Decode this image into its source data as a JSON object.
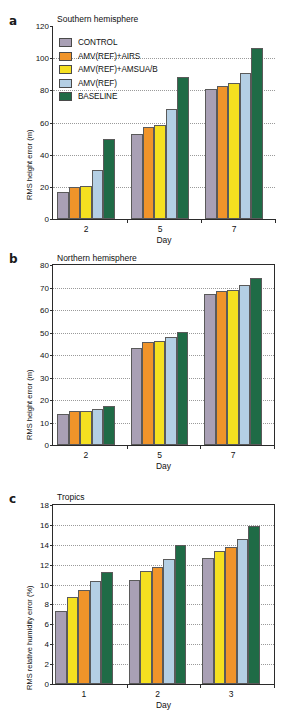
{
  "figure": {
    "xaxis_title": "Day",
    "series_colors": {
      "CONTROL": "#a9a0b5",
      "AMV(REF)+AIRS": "#f0942a",
      "AMV(REF)+AMSUA/B": "#f5e020",
      "AMV(REF)": "#b4cfe4",
      "BASELINE": "#1f6b46"
    }
  },
  "legend": {
    "items": [
      {
        "label": "CONTROL",
        "color": "#a9a0b5"
      },
      {
        "label": "AMV(REF)+AIRS",
        "color": "#f0942a"
      },
      {
        "label": "AMV(REF)+AMSUA/B",
        "color": "#f5e020"
      },
      {
        "label": "AMV(REF)",
        "color": "#b4cfe4"
      },
      {
        "label": "BASELINE",
        "color": "#1f6b46"
      }
    ]
  },
  "panels": [
    {
      "letter": "a",
      "title": "Southern hemisphere"
    },
    {
      "letter": "b",
      "title": "Northern hemisphere"
    },
    {
      "letter": "c",
      "title": "Tropics"
    }
  ],
  "chart_data": [
    {
      "type": "bar",
      "panel": "a",
      "title": "Southern hemisphere",
      "xlabel": "Day",
      "ylabel": "RMS height error (m)",
      "categories": [
        "2",
        "5",
        "7"
      ],
      "ylim": [
        0,
        120
      ],
      "yticks": [
        0,
        20,
        40,
        60,
        80,
        100,
        120
      ],
      "grid": true,
      "legend_position": "upper-left",
      "series": [
        {
          "name": "CONTROL",
          "color": "#a9a0b5",
          "values": [
            17.0,
            53.0,
            80.8
          ]
        },
        {
          "name": "AMV(REF)+AIRS",
          "color": "#f0942a",
          "values": [
            19.7,
            57.3,
            82.7
          ]
        },
        {
          "name": "AMV(REF)+AMSUA/B",
          "color": "#f5e020",
          "values": [
            20.3,
            58.7,
            84.6
          ]
        },
        {
          "name": "AMV(REF)",
          "color": "#b4cfe4",
          "values": [
            30.5,
            68.6,
            91.0
          ]
        },
        {
          "name": "BASELINE",
          "color": "#1f6b46",
          "values": [
            50.0,
            88.6,
            106.5
          ]
        }
      ]
    },
    {
      "type": "bar",
      "panel": "b",
      "title": "Northern hemisphere",
      "xlabel": "Day",
      "ylabel": "RMS height error (m)",
      "categories": [
        "2",
        "5",
        "7"
      ],
      "ylim": [
        0,
        80
      ],
      "yticks": [
        0,
        10,
        20,
        30,
        40,
        50,
        60,
        70,
        80
      ],
      "grid": true,
      "series": [
        {
          "name": "CONTROL",
          "color": "#a9a0b5",
          "values": [
            13.8,
            43.3,
            67.0
          ]
        },
        {
          "name": "AMV(REF)+AIRS",
          "color": "#f0942a",
          "values": [
            15.2,
            46.0,
            68.5
          ]
        },
        {
          "name": "AMV(REF)+AMSUA/B",
          "color": "#f5e020",
          "values": [
            15.0,
            46.2,
            68.8
          ]
        },
        {
          "name": "AMV(REF)",
          "color": "#b4cfe4",
          "values": [
            16.2,
            48.0,
            71.2
          ]
        },
        {
          "name": "BASELINE",
          "color": "#1f6b46",
          "values": [
            17.3,
            50.2,
            74.1
          ]
        }
      ]
    },
    {
      "type": "bar",
      "panel": "c",
      "title": "Tropics",
      "xlabel": "Day",
      "ylabel": "RMS relative humidity error (%)",
      "categories": [
        "1",
        "2",
        "3"
      ],
      "ylim": [
        0,
        18
      ],
      "yticks": [
        0,
        2,
        4,
        6,
        8,
        10,
        12,
        14,
        16,
        18
      ],
      "grid": true,
      "series": [
        {
          "name": "CONTROL",
          "color": "#a9a0b5",
          "values": [
            7.3,
            10.45,
            12.65
          ]
        },
        {
          "name": "AMV(REF)+AMSUA/B",
          "color": "#f5e020",
          "values": [
            8.7,
            11.35,
            13.4
          ]
        },
        {
          "name": "AMV(REF)+AIRS",
          "color": "#f0942a",
          "values": [
            9.45,
            11.75,
            13.75
          ]
        },
        {
          "name": "AMV(REF)",
          "color": "#b4cfe4",
          "values": [
            10.35,
            12.6,
            14.6
          ]
        },
        {
          "name": "BASELINE",
          "color": "#1f6b46",
          "values": [
            11.25,
            13.95,
            15.85
          ]
        }
      ]
    }
  ]
}
